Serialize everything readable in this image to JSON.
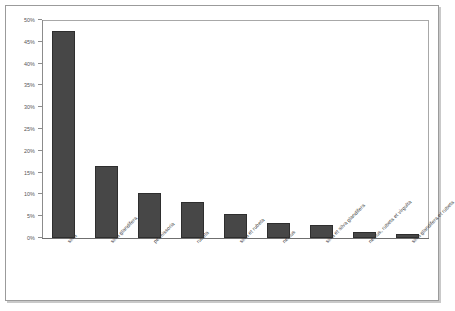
{
  "chart_data": {
    "type": "bar",
    "title": "",
    "subtitle": "",
    "xlabel": "",
    "ylabel": "",
    "ylim": [
      0,
      50
    ],
    "y_tick_labels": [
      "50%",
      "45%",
      "40%",
      "35%",
      "30%",
      "25%",
      "20%",
      "15%",
      "10%",
      "5%",
      "0%"
    ],
    "y_tick_values": [
      50,
      45,
      40,
      35,
      30,
      25,
      20,
      15,
      10,
      5,
      0
    ],
    "grid": false,
    "legend": null,
    "bar_color": "#474747",
    "bar_border_color": "#2e2e2e",
    "axis_color": "#8c8c8c",
    "frame_color": "#9b9b9b",
    "categories": [
      "silva",
      "silva glandifera",
      "permissoria",
      "rubeta",
      "silva et rubeta",
      "nemus",
      "silva et silva glandifera",
      "nemus, rubeta et virgulta",
      "silva glandifera et rubeta"
    ],
    "values": [
      47.4,
      16.5,
      10.3,
      8.3,
      5.4,
      3.4,
      2.9,
      1.4,
      0.9
    ],
    "units": "%"
  }
}
